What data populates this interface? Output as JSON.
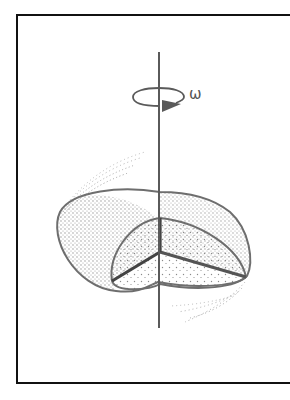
{
  "figure": {
    "type": "physics-illustration",
    "rotation_label": "ω",
    "icons": {
      "rotation_arrow": "circular-arrow-icon",
      "axis": "rotation-axis"
    },
    "colors": {
      "frame": "#111111",
      "lines": "#6e6e6e",
      "cut_edges": "#444444",
      "stipple": "#8a8a8a",
      "background": "#ffffff"
    }
  }
}
